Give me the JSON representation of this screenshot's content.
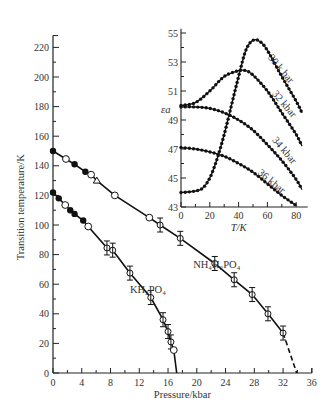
{
  "chart_data": [
    {
      "type": "line",
      "title": "",
      "xlabel": "Pressure/kbar",
      "ylabel": "Transition temperature/K",
      "xlim": [
        0,
        36
      ],
      "ylim": [
        0,
        230
      ],
      "xticks": [
        0,
        4,
        8,
        12,
        16,
        20,
        24,
        28,
        32,
        36
      ],
      "yticks": [
        0,
        20,
        40,
        60,
        80,
        100,
        120,
        140,
        160,
        180,
        200,
        220
      ],
      "grid": false,
      "series": [
        {
          "name": "NH4H2PO4",
          "label": "NH₄H₂PO₄",
          "points": [
            [
              0,
              150
            ],
            [
              1.8,
              144.6
            ],
            [
              3,
              141
            ],
            [
              4.5,
              136
            ],
            [
              5.3,
              134
            ],
            [
              6.1,
              130
            ],
            [
              8.6,
              120
            ],
            [
              13.4,
              105
            ],
            [
              14.9,
              100
            ],
            [
              17.7,
              91
            ],
            [
              22.5,
              74
            ],
            [
              25.2,
              63
            ],
            [
              27.7,
              53
            ],
            [
              29.9,
              40
            ],
            [
              32,
              27
            ]
          ],
          "dashed_extension": [
            [
              32,
              27
            ],
            [
              33.9,
              0
            ]
          ]
        },
        {
          "name": "KH2PO4",
          "label": "KH₂PO₄",
          "points": [
            [
              0,
              122
            ],
            [
              0.8,
              118
            ],
            [
              1.7,
              113.5
            ],
            [
              2.4,
              110
            ],
            [
              3,
              107.5
            ],
            [
              4.2,
              103
            ],
            [
              4.9,
              99
            ],
            [
              7.5,
              84.5
            ],
            [
              8.3,
              83
            ],
            [
              10.7,
              67.5
            ],
            [
              13.6,
              51
            ],
            [
              15.3,
              36
            ],
            [
              16,
              28
            ],
            [
              16.4,
              21
            ],
            [
              16.8,
              15.5
            ],
            [
              17.2,
              0
            ]
          ]
        }
      ]
    },
    {
      "type": "line",
      "title": "inset",
      "xlabel": "T/K",
      "ylabel": "εa",
      "xlim": [
        0,
        85
      ],
      "ylim": [
        43,
        55
      ],
      "xticks": [
        0,
        20,
        40,
        60,
        80
      ],
      "yticks": [
        43,
        45,
        47,
        49,
        51,
        53,
        55
      ],
      "series": [
        {
          "name": "30 k bar",
          "points": [
            [
              0,
              44
            ],
            [
              10,
              44.1
            ],
            [
              15,
              44.3
            ],
            [
              20,
              45
            ],
            [
              25,
              46.3
            ],
            [
              30,
              48
            ],
            [
              35,
              50
            ],
            [
              40,
              52
            ],
            [
              45,
              53.8
            ],
            [
              50,
              54.5
            ],
            [
              55,
              54.4
            ],
            [
              60,
              53.8
            ],
            [
              70,
              52
            ],
            [
              80,
              50.3
            ],
            [
              84,
              49.5
            ]
          ]
        },
        {
          "name": "32 kbar",
          "points": [
            [
              0,
              50
            ],
            [
              10,
              50.2
            ],
            [
              20,
              51
            ],
            [
              30,
              52
            ],
            [
              40,
              52.4
            ],
            [
              45,
              52.4
            ],
            [
              50,
              52.1
            ],
            [
              60,
              51
            ],
            [
              70,
              49.5
            ],
            [
              80,
              48
            ],
            [
              84,
              47.2
            ]
          ]
        },
        {
          "name": "34 kbar",
          "points": [
            [
              0,
              49.9
            ],
            [
              10,
              49.9
            ],
            [
              20,
              49.8
            ],
            [
              30,
              49.5
            ],
            [
              40,
              49
            ],
            [
              50,
              48.3
            ],
            [
              60,
              47.3
            ],
            [
              70,
              46.2
            ],
            [
              80,
              44.9
            ],
            [
              84,
              44.2
            ]
          ]
        },
        {
          "name": "36 kbar",
          "points": [
            [
              0,
              47.1
            ],
            [
              10,
              47
            ],
            [
              20,
              46.8
            ],
            [
              30,
              46.5
            ],
            [
              40,
              46
            ],
            [
              50,
              45.4
            ],
            [
              60,
              44.6
            ],
            [
              70,
              43.8
            ],
            [
              80,
              43.1
            ]
          ]
        }
      ]
    }
  ],
  "labels": {
    "xlabel": "Pressure/kbar",
    "ylabel": "Transition temperature/K",
    "nh4": "NH₄H₂PO₄",
    "kh2": "KH₂PO₄",
    "inset_xlabel": "T/K",
    "inset_ylabel": "εa",
    "s30": "30 k bar",
    "s32": "32 kbar",
    "s34": "34 kbar",
    "s36": "36 kbar"
  }
}
